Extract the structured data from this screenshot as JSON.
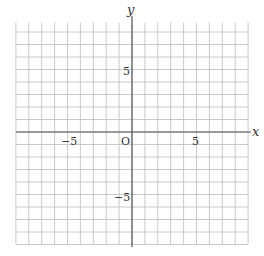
{
  "diagram": {
    "type": "coordinate-grid",
    "x_axis": {
      "label": "x",
      "min": -9,
      "max": 9,
      "tick_labels": [
        "−5",
        "5"
      ]
    },
    "y_axis": {
      "label": "y",
      "min": -9,
      "max": 9,
      "tick_labels": [
        "5",
        "−5"
      ]
    },
    "origin_label": "O",
    "grid_color": "#bdbdbd",
    "axis_color": "#555555"
  }
}
